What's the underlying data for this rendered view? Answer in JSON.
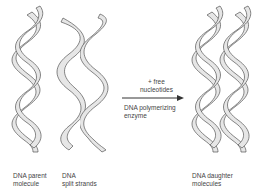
{
  "diagram": {
    "stages": [
      {
        "id": "parent",
        "label_line1": "DNA parent",
        "label_line2": "molecule"
      },
      {
        "id": "split",
        "label_line1": "DNA",
        "label_line2": "split strands"
      },
      {
        "id": "daughter",
        "label_line1": "DNA daughter",
        "label_line2": "molecules"
      }
    ],
    "arrow": {
      "above_line1": "+ free",
      "above_line2": "nucleotides",
      "below_line1": "DNA polymerizing",
      "below_line2": "enzyme"
    },
    "colors": {
      "stroke": "#555555",
      "fill": "#e6e6e6",
      "background": "#ffffff"
    }
  }
}
